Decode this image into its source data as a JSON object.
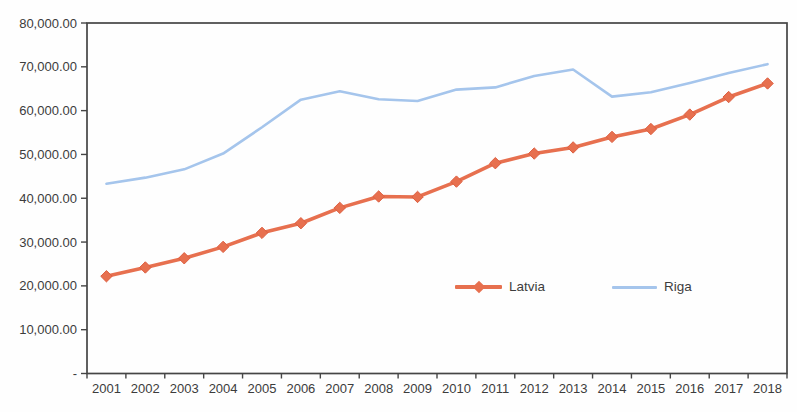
{
  "chart_data": {
    "type": "line",
    "title": "",
    "xlabel": "",
    "ylabel": "",
    "categories": [
      "2001",
      "2002",
      "2003",
      "2004",
      "2005",
      "2006",
      "2007",
      "2008",
      "2009",
      "2010",
      "2011",
      "2012",
      "2013",
      "2014",
      "2015",
      "2016",
      "2017",
      "2018"
    ],
    "series": [
      {
        "name": "Latvia",
        "color": "#e7704f",
        "marker": "diamond",
        "marker_stroke": "#de5f41",
        "line_width": 3.6,
        "values": [
          22200,
          24200,
          26300,
          28900,
          32100,
          34300,
          37800,
          40400,
          40300,
          43800,
          48000,
          50200,
          51600,
          54000,
          55800,
          59100,
          63100,
          66200
        ]
      },
      {
        "name": "Riga",
        "color": "#a5c5ec",
        "marker": "none",
        "marker_stroke": "",
        "line_width": 2.6,
        "values": [
          43300,
          44700,
          46600,
          50200,
          56200,
          62500,
          64400,
          62600,
          62200,
          64800,
          65300,
          67900,
          69400,
          63200,
          64200,
          66300,
          68600,
          70600
        ]
      }
    ],
    "ylim": [
      0,
      80000
    ],
    "y_tick_step": 10000,
    "y_tick_labels": [
      "-",
      "10,000.00",
      "20,000.00",
      "30,000.00",
      "40,000.00",
      "50,000.00",
      "60,000.00",
      "70,000.00",
      "80,000.00"
    ],
    "grid": false,
    "legend_position": "inside-lower-middle",
    "axis_color": "#454545",
    "tick_label_color": "#3c3c3c"
  }
}
